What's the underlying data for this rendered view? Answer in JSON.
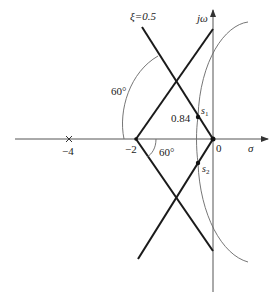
{
  "diagram": {
    "type": "root-locus-s-plane",
    "axes": {
      "real_axis_label": "σ",
      "imag_axis_label": "jω",
      "origin_label": "0"
    },
    "tick_labels": {
      "minus4": "−4",
      "minus2": "−2"
    },
    "annotations": {
      "damping_line": "ξ=0.5",
      "angle_upper": "60°",
      "angle_lower": "60°",
      "distance": "0.84",
      "s1_main": "s",
      "s1_sub": "1",
      "s2_main": "s",
      "s2_sub": "2"
    },
    "poles": [
      {
        "label": "−4",
        "marker": "x"
      }
    ],
    "colors": {
      "line": "#1a1a1a",
      "axis": "#555555",
      "curve": "#666666"
    }
  }
}
